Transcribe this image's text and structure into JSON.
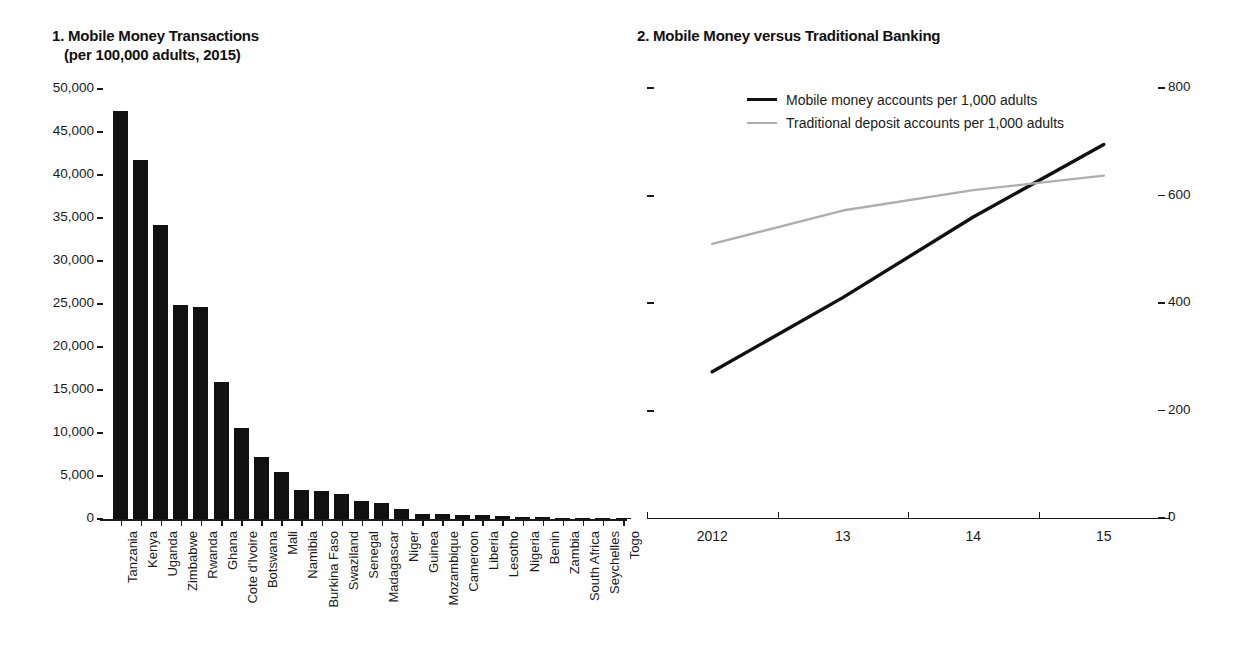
{
  "chart_data": [
    {
      "type": "bar",
      "panel": "1",
      "title": "1. Mobile Money Transactions",
      "subtitle": "(per 100,000 adults, 2015)",
      "xlabel": "",
      "ylabel": "",
      "ylim": [
        0,
        50000
      ],
      "ytick_labels": [
        "50,000",
        "45,000",
        "40,000",
        "35,000",
        "30,000",
        "25,000",
        "20,000",
        "15,000",
        "10,000",
        "5,000",
        "0"
      ],
      "ytick_values": [
        50000,
        45000,
        40000,
        35000,
        30000,
        25000,
        20000,
        15000,
        10000,
        5000,
        0
      ],
      "grid": false,
      "legend": "none",
      "bar_color": "#111111",
      "categories": [
        "Tanzania",
        "Kenya",
        "Uganda",
        "Zimbabwe",
        "Rwanda",
        "Ghana",
        "Cote d'Ivoire",
        "Botswana",
        "Mali",
        "Namibia",
        "Burkina Faso",
        "Swaziland",
        "Senegal",
        "Madagascar",
        "Niger",
        "Guinea",
        "Mozambique",
        "Cameroon",
        "Liberia",
        "Lesotho",
        "Nigeria",
        "Benin",
        "Zambia",
        "South Africa",
        "Seychelles",
        "Togo"
      ],
      "values": [
        47500,
        41700,
        34200,
        24900,
        24600,
        15900,
        10600,
        7200,
        5500,
        3400,
        3300,
        2900,
        2100,
        1900,
        1200,
        600,
        550,
        500,
        450,
        400,
        250,
        200,
        150,
        120,
        90,
        60
      ]
    },
    {
      "type": "line",
      "panel": "2",
      "title": "2. Mobile Money versus Traditional Banking",
      "xlabel": "",
      "ylabel": "",
      "ylim": [
        0,
        800
      ],
      "ytick_labels": [
        "800",
        "600",
        "400",
        "200",
        "0"
      ],
      "ytick_values": [
        800,
        600,
        400,
        200,
        0
      ],
      "axis_position": "right",
      "grid": false,
      "legend_position": "top-left",
      "x": [
        "2012",
        "13",
        "14",
        "15"
      ],
      "series": [
        {
          "name": "Mobile money accounts per 1,000 adults",
          "color": "#111111",
          "values": [
            272,
            410,
            560,
            695
          ]
        },
        {
          "name": "Traditional deposit accounts per 1,000 adults",
          "color": "#aeaeae",
          "values": [
            510,
            572,
            610,
            637
          ]
        }
      ]
    }
  ]
}
